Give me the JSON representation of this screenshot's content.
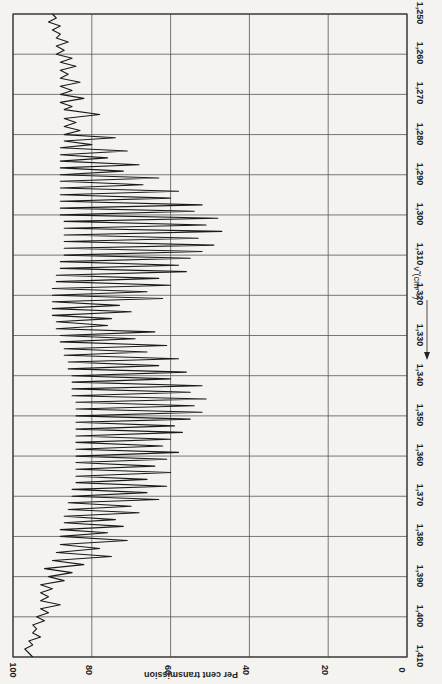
{
  "chart_data": {
    "type": "line",
    "orientation": "rotated-90deg",
    "title": "",
    "xlabel": "ν̃ (cm⁻¹)",
    "ylabel": "Per cent transmission",
    "xlim": [
      1250,
      1410
    ],
    "ylim": [
      0,
      100
    ],
    "x_ticks": [
      "1,250",
      "1,260",
      "1,270",
      "1,280",
      "1,290",
      "1,300",
      "1,310",
      "1,320",
      "1,330",
      "1,340",
      "1,350",
      "1,360",
      "1,370",
      "1,380",
      "1,390",
      "1,400",
      "1,410"
    ],
    "y_ticks": [
      "100",
      "80",
      "60",
      "40",
      "20",
      "0"
    ],
    "grid": true,
    "series": [
      {
        "name": "spectrum",
        "color": "#1a1a1a",
        "points": [
          [
            1250.0,
            90
          ],
          [
            1251.0,
            89
          ],
          [
            1252.0,
            91
          ],
          [
            1253.0,
            88
          ],
          [
            1254.0,
            90
          ],
          [
            1255.0,
            88
          ],
          [
            1256.0,
            89
          ],
          [
            1257.0,
            86
          ],
          [
            1258.0,
            89
          ],
          [
            1259.0,
            87
          ],
          [
            1260.0,
            89
          ],
          [
            1261.0,
            85
          ],
          [
            1262.0,
            88
          ],
          [
            1263.0,
            84
          ],
          [
            1264.0,
            88
          ],
          [
            1265.0,
            86
          ],
          [
            1266.0,
            88
          ],
          [
            1267.0,
            83
          ],
          [
            1268.0,
            88
          ],
          [
            1269.0,
            85
          ],
          [
            1270.0,
            88
          ],
          [
            1271.0,
            82
          ],
          [
            1272.0,
            88
          ],
          [
            1273.0,
            85
          ],
          [
            1273.8,
            87
          ],
          [
            1275.0,
            78
          ],
          [
            1276.0,
            87
          ],
          [
            1277.0,
            84
          ],
          [
            1278.0,
            87
          ],
          [
            1279.0,
            83
          ],
          [
            1280.0,
            87
          ],
          [
            1280.8,
            74
          ],
          [
            1281.6,
            87
          ],
          [
            1282.5,
            80
          ],
          [
            1283.3,
            88
          ],
          [
            1284.1,
            71
          ],
          [
            1285.0,
            88
          ],
          [
            1285.8,
            76
          ],
          [
            1286.6,
            88
          ],
          [
            1287.5,
            68
          ],
          [
            1288.3,
            88
          ],
          [
            1289.1,
            72
          ],
          [
            1290.0,
            88
          ],
          [
            1290.8,
            63
          ],
          [
            1291.6,
            88
          ],
          [
            1292.5,
            67
          ],
          [
            1293.3,
            88
          ],
          [
            1294.1,
            58
          ],
          [
            1295.0,
            88
          ],
          [
            1295.8,
            60
          ],
          [
            1296.6,
            88
          ],
          [
            1297.5,
            52
          ],
          [
            1298.3,
            88
          ],
          [
            1299.1,
            54
          ],
          [
            1300.0,
            88
          ],
          [
            1300.8,
            48
          ],
          [
            1301.6,
            87
          ],
          [
            1302.5,
            51
          ],
          [
            1303.3,
            87
          ],
          [
            1304.1,
            47
          ],
          [
            1305.0,
            87
          ],
          [
            1305.8,
            53
          ],
          [
            1306.6,
            87
          ],
          [
            1307.5,
            49
          ],
          [
            1308.3,
            87
          ],
          [
            1309.1,
            52
          ],
          [
            1310.0,
            87
          ],
          [
            1310.8,
            55
          ],
          [
            1311.6,
            88
          ],
          [
            1312.5,
            58
          ],
          [
            1313.3,
            88
          ],
          [
            1314.1,
            56
          ],
          [
            1315.0,
            89
          ],
          [
            1315.8,
            63
          ],
          [
            1316.6,
            89
          ],
          [
            1317.5,
            60
          ],
          [
            1318.3,
            90
          ],
          [
            1319.1,
            66
          ],
          [
            1320.0,
            90
          ],
          [
            1320.8,
            62
          ],
          [
            1321.6,
            90
          ],
          [
            1322.5,
            73
          ],
          [
            1323.3,
            90
          ],
          [
            1324.1,
            70
          ],
          [
            1325.0,
            90
          ],
          [
            1325.8,
            75
          ],
          [
            1326.6,
            89
          ],
          [
            1327.5,
            76
          ],
          [
            1328.3,
            89
          ],
          [
            1329.1,
            64
          ],
          [
            1330.0,
            88
          ],
          [
            1330.8,
            69
          ],
          [
            1331.6,
            88
          ],
          [
            1332.5,
            61
          ],
          [
            1333.3,
            87
          ],
          [
            1334.1,
            66
          ],
          [
            1334.9,
            87
          ],
          [
            1335.8,
            58
          ],
          [
            1336.6,
            86
          ],
          [
            1337.5,
            63
          ],
          [
            1338.3,
            86
          ],
          [
            1339.1,
            56
          ],
          [
            1340.0,
            85
          ],
          [
            1340.8,
            60
          ],
          [
            1341.6,
            85
          ],
          [
            1342.5,
            52
          ],
          [
            1343.3,
            85
          ],
          [
            1344.1,
            55
          ],
          [
            1345.0,
            85
          ],
          [
            1345.8,
            51
          ],
          [
            1346.6,
            84
          ],
          [
            1347.5,
            54
          ],
          [
            1348.3,
            84
          ],
          [
            1349.1,
            52
          ],
          [
            1350.0,
            84
          ],
          [
            1350.8,
            55
          ],
          [
            1351.6,
            84
          ],
          [
            1352.5,
            59
          ],
          [
            1353.3,
            84
          ],
          [
            1354.1,
            57
          ],
          [
            1355.0,
            84
          ],
          [
            1355.8,
            60
          ],
          [
            1356.6,
            84
          ],
          [
            1357.5,
            62
          ],
          [
            1358.3,
            84
          ],
          [
            1359.1,
            58
          ],
          [
            1360.0,
            84
          ],
          [
            1360.8,
            61
          ],
          [
            1361.6,
            84
          ],
          [
            1362.5,
            64
          ],
          [
            1363.3,
            84
          ],
          [
            1364.1,
            60
          ],
          [
            1365.0,
            84
          ],
          [
            1365.8,
            66
          ],
          [
            1366.6,
            84
          ],
          [
            1367.5,
            61
          ],
          [
            1368.3,
            85
          ],
          [
            1369.1,
            66
          ],
          [
            1370.0,
            85
          ],
          [
            1370.8,
            63
          ],
          [
            1371.6,
            86
          ],
          [
            1372.5,
            70
          ],
          [
            1373.3,
            86
          ],
          [
            1374.1,
            68
          ],
          [
            1375.0,
            87
          ],
          [
            1375.8,
            74
          ],
          [
            1376.6,
            87
          ],
          [
            1377.5,
            72
          ],
          [
            1378.3,
            88
          ],
          [
            1379.1,
            76
          ],
          [
            1380.0,
            88
          ],
          [
            1381.0,
            71
          ],
          [
            1382.0,
            88
          ],
          [
            1383.0,
            78
          ],
          [
            1384.0,
            89
          ],
          [
            1385.0,
            75
          ],
          [
            1386.0,
            90
          ],
          [
            1387.0,
            82
          ],
          [
            1388.0,
            92
          ],
          [
            1389.0,
            85
          ],
          [
            1390.0,
            91
          ],
          [
            1391.0,
            87
          ],
          [
            1392.0,
            93
          ],
          [
            1393.0,
            90
          ],
          [
            1394.0,
            93
          ],
          [
            1395.0,
            91
          ],
          [
            1396.0,
            93
          ],
          [
            1397.0,
            88
          ],
          [
            1398.0,
            93
          ],
          [
            1399.0,
            91
          ],
          [
            1400.0,
            94
          ],
          [
            1401.0,
            92
          ],
          [
            1402.0,
            95
          ],
          [
            1403.0,
            94
          ],
          [
            1404.0,
            95
          ],
          [
            1405.0,
            93
          ],
          [
            1406.0,
            96
          ],
          [
            1407.0,
            95
          ],
          [
            1408.0,
            97
          ],
          [
            1409.0,
            96
          ],
          [
            1410.0,
            95
          ]
        ]
      }
    ],
    "annotations": [
      "ν̃ (cm⁻¹) arrow pointing toward increasing wavenumber"
    ]
  },
  "style": {
    "background": "#f4f3ef",
    "grid_color": "#555555",
    "trace_color": "#1a1a1a"
  },
  "layout": {
    "plot_left": 13,
    "plot_right": 407,
    "plot_top": 14,
    "plot_bottom": 657
  }
}
